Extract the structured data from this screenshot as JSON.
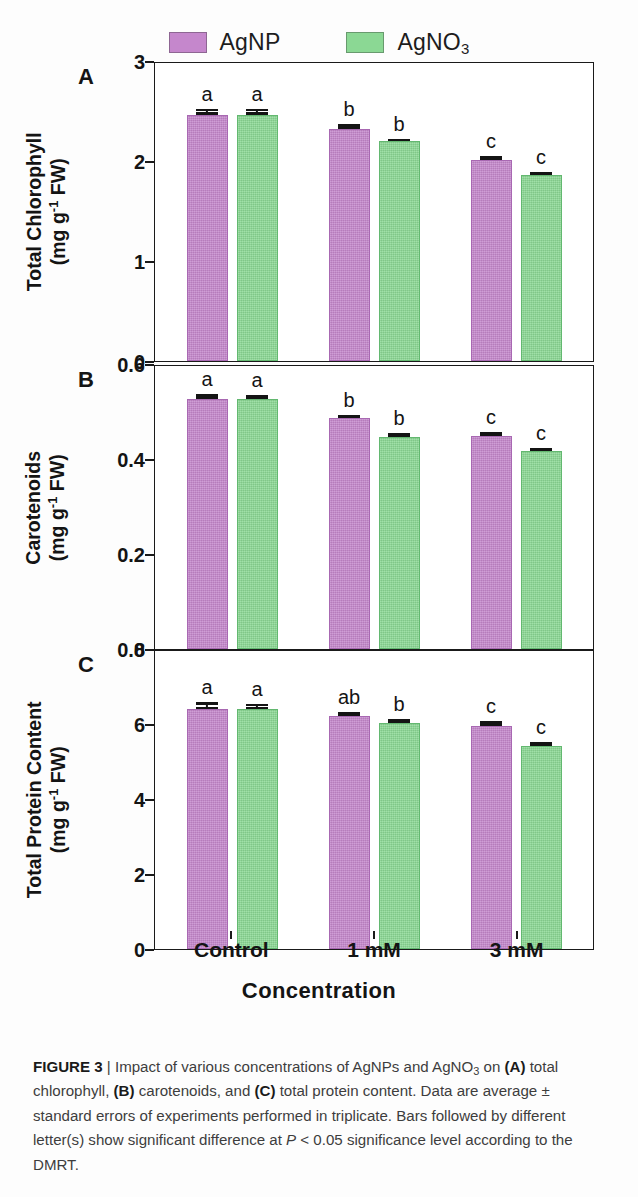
{
  "legend": {
    "entries": [
      {
        "name": "AgNP",
        "label_main": "AgNP",
        "label_sub": "",
        "color": "#c587cc",
        "swatch_icon": "purple-square-swatch"
      },
      {
        "name": "AgNO3",
        "label_main": "AgNO",
        "label_sub": "3",
        "color": "#8bd894",
        "swatch_icon": "green-square-swatch"
      }
    ]
  },
  "xaxis": {
    "title": "Concentration",
    "categories": [
      "Control",
      "1 mM",
      "3 mM"
    ]
  },
  "panels": [
    {
      "letter": "A",
      "ylabel_line1": "Total Chlorophyll",
      "ylabel_line2_pre": "(mg g",
      "ylabel_line2_sup": "-1",
      "ylabel_line2_post": " FW)",
      "ticks": [
        "0",
        "1",
        "2",
        "3"
      ]
    },
    {
      "letter": "B",
      "ylabel_line1": "Carotenoids",
      "ylabel_line2_pre": "(mg g",
      "ylabel_line2_sup": "-1",
      "ylabel_line2_post": " FW)",
      "ticks": [
        "0.0",
        "0.2",
        "0.4",
        "0.6"
      ]
    },
    {
      "letter": "C",
      "ylabel_line1": "Total Protein Content",
      "ylabel_line2_pre": "(mg g",
      "ylabel_line2_sup": "-1",
      "ylabel_line2_post": " FW)",
      "ticks": [
        "0",
        "2",
        "4",
        "6",
        "8"
      ]
    }
  ],
  "caption": {
    "figure_label": "FIGURE 3",
    "separator": "|",
    "text_1": " Impact of various concentrations of AgNPs and AgNO",
    "text_1_sub": "3",
    "text_2": " on ",
    "bold_a": "(A)",
    "text_3": " total chlorophyll, ",
    "bold_b": "(B)",
    "text_4": " carotenoids, and ",
    "bold_c": "(C)",
    "text_5": " total protein content. Data are average ± standard errors of experiments performed in triplicate. Bars followed by different letter(s) show significant difference at ",
    "italic_p": "P",
    "text_6": " < 0.05 significance level according to the DMRT."
  },
  "chart_data": [
    {
      "type": "bar",
      "panel": "A",
      "title": "",
      "xlabel": "Concentration",
      "ylabel": "Total Chlorophyll (mg g-1 FW)",
      "categories": [
        "Control",
        "1 mM",
        "3 mM"
      ],
      "ylim": [
        0,
        3
      ],
      "yticks": [
        0,
        1,
        2,
        3
      ],
      "grid": false,
      "legend_position": "top-center",
      "series": [
        {
          "name": "AgNP",
          "color": "#c587cc",
          "values": [
            2.48,
            2.34,
            2.02
          ],
          "errors": [
            0.06,
            0.05,
            0.04
          ],
          "letters": [
            "a",
            "b",
            "c"
          ]
        },
        {
          "name": "AgNO3",
          "color": "#8bd894",
          "values": [
            2.48,
            2.21,
            1.87
          ],
          "errors": [
            0.06,
            0.03,
            0.03
          ],
          "letters": [
            "a",
            "b",
            "c"
          ]
        }
      ]
    },
    {
      "type": "bar",
      "panel": "B",
      "title": "",
      "xlabel": "Concentration",
      "ylabel": "Carotenoids (mg g-1 FW)",
      "categories": [
        "Control",
        "1 mM",
        "3 mM"
      ],
      "ylim": [
        0,
        0.6
      ],
      "yticks": [
        0.0,
        0.2,
        0.4,
        0.6
      ],
      "grid": false,
      "legend_position": "top-center",
      "series": [
        {
          "name": "AgNP",
          "color": "#c587cc",
          "values": [
            0.531,
            0.49,
            0.452
          ],
          "errors": [
            0.01,
            0.006,
            0.008
          ],
          "letters": [
            "a",
            "b",
            "c"
          ]
        },
        {
          "name": "AgNO3",
          "color": "#8bd894",
          "values": [
            0.53,
            0.45,
            0.42
          ],
          "errors": [
            0.009,
            0.008,
            0.006
          ],
          "letters": [
            "a",
            "b",
            "c"
          ]
        }
      ]
    },
    {
      "type": "bar",
      "panel": "C",
      "title": "",
      "xlabel": "Concentration",
      "ylabel": "Total Protein Content (mg g-1 FW)",
      "categories": [
        "Control",
        "1 mM",
        "3 mM"
      ],
      "ylim": [
        0,
        8
      ],
      "yticks": [
        0,
        2,
        4,
        6,
        8
      ],
      "grid": false,
      "legend_position": "top-center",
      "series": [
        {
          "name": "AgNP",
          "color": "#c587cc",
          "values": [
            6.45,
            6.25,
            6.0
          ],
          "errors": [
            0.17,
            0.1,
            0.13
          ],
          "letters": [
            "a",
            "ab",
            "c"
          ]
        },
        {
          "name": "AgNO3",
          "color": "#8bd894",
          "values": [
            6.45,
            6.07,
            5.44
          ],
          "errors": [
            0.14,
            0.1,
            0.11
          ],
          "letters": [
            "a",
            "b",
            "c"
          ]
        }
      ]
    }
  ]
}
